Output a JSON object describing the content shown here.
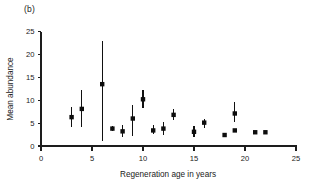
{
  "figure": {
    "panel_label": "(b)",
    "background": "#ffffff",
    "ink_color": "#111111"
  },
  "chart_data": {
    "type": "scatter",
    "title": "",
    "subtitle": "",
    "panel": "(b)",
    "xlabel": "Regeneration age in years",
    "ylabel": "Mean abundance",
    "xlim": [
      0,
      25
    ],
    "ylim": [
      0,
      25
    ],
    "xticks": [
      0,
      5,
      10,
      15,
      20,
      25
    ],
    "yticks": [
      0,
      5,
      10,
      15,
      20,
      25
    ],
    "xticklabels": [
      "0",
      "5",
      "10",
      "15",
      "20",
      "25"
    ],
    "yticklabels": [
      "0",
      "5",
      "10",
      "15",
      "20",
      "25"
    ],
    "grid": false,
    "legend": null,
    "marker": "square",
    "errorbars": "vertical",
    "x": [
      3,
      4,
      6,
      7,
      8,
      9,
      10,
      11,
      12,
      13,
      15,
      16,
      18,
      19,
      19,
      21,
      22
    ],
    "y": [
      6.3,
      8.1,
      13.5,
      3.8,
      3.2,
      6.0,
      10.2,
      3.4,
      3.8,
      6.8,
      3.1,
      5.1,
      2.4,
      7.1,
      3.4,
      3.0,
      3.0
    ],
    "y_lower": [
      4.2,
      4.2,
      1.2,
      3.3,
      2.0,
      2.2,
      8.3,
      2.6,
      2.4,
      5.7,
      2.0,
      4.0,
      2.4,
      5.3,
      3.4,
      3.0,
      3.0
    ],
    "y_upper": [
      8.5,
      12.2,
      23.0,
      4.4,
      4.5,
      9.0,
      12.2,
      4.6,
      5.2,
      8.0,
      4.3,
      6.0,
      2.4,
      9.6,
      3.4,
      3.0,
      3.0
    ],
    "points": [
      {
        "age": 3,
        "mean": 6.3,
        "lower": 4.2,
        "upper": 8.5
      },
      {
        "age": 4,
        "mean": 8.1,
        "lower": 4.2,
        "upper": 12.2
      },
      {
        "age": 6,
        "mean": 13.5,
        "lower": 1.2,
        "upper": 23.0
      },
      {
        "age": 7,
        "mean": 3.8,
        "lower": 3.3,
        "upper": 4.4
      },
      {
        "age": 8,
        "mean": 3.2,
        "lower": 2.0,
        "upper": 4.5
      },
      {
        "age": 9,
        "mean": 6.0,
        "lower": 2.2,
        "upper": 9.0
      },
      {
        "age": 10,
        "mean": 10.2,
        "lower": 8.3,
        "upper": 12.2
      },
      {
        "age": 11,
        "mean": 3.4,
        "lower": 2.6,
        "upper": 4.6
      },
      {
        "age": 12,
        "mean": 3.8,
        "lower": 2.4,
        "upper": 5.2
      },
      {
        "age": 13,
        "mean": 6.8,
        "lower": 5.7,
        "upper": 8.0
      },
      {
        "age": 15,
        "mean": 3.1,
        "lower": 2.0,
        "upper": 4.3
      },
      {
        "age": 16,
        "mean": 5.1,
        "lower": 4.0,
        "upper": 6.0
      },
      {
        "age": 18,
        "mean": 2.4,
        "lower": 2.4,
        "upper": 2.4
      },
      {
        "age": 19,
        "mean": 7.1,
        "lower": 5.3,
        "upper": 9.6
      },
      {
        "age": 19,
        "mean": 3.4,
        "lower": 3.4,
        "upper": 3.4
      },
      {
        "age": 21,
        "mean": 3.0,
        "lower": 3.0,
        "upper": 3.0
      },
      {
        "age": 22,
        "mean": 3.0,
        "lower": 3.0,
        "upper": 3.0
      }
    ]
  }
}
